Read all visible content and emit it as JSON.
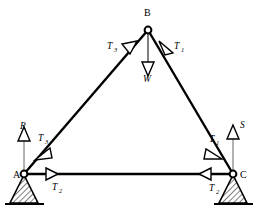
{
  "figure": {
    "kind": "free-body-diagram",
    "background_color": "#ffffff",
    "line_color": "#000000"
  },
  "nodes": [
    {
      "id": "A",
      "label": "A",
      "x": 24,
      "y": 174,
      "label_x": 13,
      "label_y": 178,
      "joint": "open-circle"
    },
    {
      "id": "B",
      "label": "B",
      "x": 148,
      "y": 30,
      "label_x": 145,
      "label_y": 16,
      "joint": "open-circle"
    },
    {
      "id": "C",
      "label": "C",
      "x": 233,
      "y": 174,
      "label_x": 240,
      "label_y": 178,
      "joint": "open-circle"
    }
  ],
  "members": [
    {
      "id": "AB",
      "from": "A",
      "to": "B",
      "name": "left-rafter"
    },
    {
      "id": "BC",
      "from": "B",
      "to": "C",
      "name": "right-rafter"
    },
    {
      "id": "AC",
      "from": "A",
      "to": "C",
      "name": "bottom-chord"
    }
  ],
  "supports": [
    {
      "at": "A",
      "type": "hatched-triangle-pin",
      "ground_line": true
    },
    {
      "at": "C",
      "type": "hatched-triangle-pin",
      "ground_line": true
    }
  ],
  "forces": [
    {
      "id": "W",
      "label": "W",
      "sub": "",
      "direction": "down",
      "applied_at": "B",
      "label_x": 144,
      "label_y": 80,
      "arrow": "open-triangle"
    },
    {
      "id": "R",
      "label": "R",
      "sub": "",
      "direction": "up",
      "applied_at": "A",
      "label_x": 21,
      "label_y": 128,
      "arrow": "open-triangle"
    },
    {
      "id": "S",
      "label": "S",
      "sub": "",
      "direction": "up",
      "applied_at": "C",
      "label_x": 238,
      "label_y": 127,
      "arrow": "open-triangle"
    },
    {
      "id": "T1_top",
      "label": "T",
      "sub": "1",
      "direction": "up-left",
      "applied_at": "B",
      "label_x": 176,
      "label_y": 48,
      "arrow": "open-triangle"
    },
    {
      "id": "T3_top",
      "label": "T",
      "sub": "3",
      "direction": "up-right",
      "applied_at": "B",
      "label_x": 110,
      "label_y": 48,
      "arrow": "open-triangle"
    },
    {
      "id": "T3_bottom",
      "label": "T",
      "sub": "3",
      "direction": "down-left",
      "applied_at": "A",
      "label_x": 40,
      "label_y": 140,
      "arrow": "open-triangle"
    },
    {
      "id": "T1_bottom",
      "label": "T",
      "sub": "1",
      "direction": "down-right",
      "applied_at": "C",
      "label_x": 212,
      "label_y": 141,
      "arrow": "open-triangle"
    },
    {
      "id": "T2_left",
      "label": "T",
      "sub": "2",
      "direction": "right",
      "applied_at": "A",
      "label_x": 54,
      "label_y": 189,
      "arrow": "open-triangle"
    },
    {
      "id": "T2_right",
      "label": "T",
      "sub": "2",
      "direction": "left",
      "applied_at": "C",
      "label_x": 212,
      "label_y": 190,
      "arrow": "open-triangle"
    }
  ]
}
